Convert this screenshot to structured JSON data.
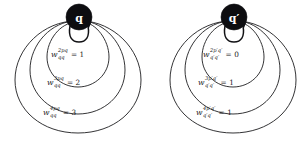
{
  "figure": {
    "type": "diagram",
    "panels": [
      {
        "id": "left",
        "node": {
          "label": "q",
          "shape": "filled-circle",
          "fill": "#0d0d10",
          "text_color": "#ffffff"
        },
        "loops": [
          {
            "index": 1,
            "symbol": "w",
            "superscript": "2pq",
            "subscript": "qq",
            "equals": "=",
            "value": "1"
          },
          {
            "index": 2,
            "symbol": "w",
            "superscript": "3pq",
            "subscript": "qq",
            "equals": "=",
            "value": "2"
          },
          {
            "index": 3,
            "symbol": "w",
            "superscript": "4pq",
            "subscript": "qq",
            "equals": "=",
            "value": "3"
          }
        ]
      },
      {
        "id": "right",
        "node": {
          "label": "q′",
          "shape": "filled-circle",
          "fill": "#0d0d10",
          "text_color": "#ffffff"
        },
        "loops": [
          {
            "index": 1,
            "symbol": "w",
            "superscript": "2p′q′",
            "subscript": "q′q′",
            "equals": "=",
            "value": "0"
          },
          {
            "index": 2,
            "symbol": "w",
            "superscript": "3p′q′",
            "subscript": "q′q′",
            "equals": "=",
            "value": "1"
          },
          {
            "index": 3,
            "symbol": "w",
            "superscript": "4p′q′",
            "subscript": "q′q′",
            "equals": "=",
            "value": "1"
          }
        ]
      }
    ],
    "colors": {
      "stroke": "#1d1d1f",
      "node_fill": "#0d0d10",
      "background": "#ffffff"
    }
  }
}
